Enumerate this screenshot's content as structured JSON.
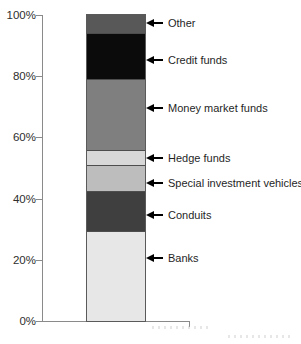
{
  "chart_data": {
    "type": "bar",
    "subtype": "stacked-percentage-column",
    "title": "",
    "xlabel": "",
    "ylabel": "",
    "categories": [
      ""
    ],
    "series": [
      {
        "name": "Banks",
        "value": 29.5,
        "color": "#e7e7e7"
      },
      {
        "name": "Conduits",
        "value": 13,
        "color": "#3f3f3f"
      },
      {
        "name": "Special investment vehicles",
        "value": 8.5,
        "color": "#bdbdbd"
      },
      {
        "name": "Hedge funds",
        "value": 5,
        "color": "#d8d8d8"
      },
      {
        "name": "Money market funds",
        "value": 23,
        "color": "#7f7f7f"
      },
      {
        "name": "Credit funds",
        "value": 15,
        "color": "#0b0b0b"
      },
      {
        "name": "Other",
        "value": 6,
        "color": "#585858"
      }
    ],
    "ylim": [
      0,
      100
    ],
    "y_ticks": [
      "0%",
      "20%",
      "40%",
      "60%",
      "80%",
      "100%"
    ],
    "grid": false,
    "legend_position": "arrow-callouts-right"
  },
  "colors": {
    "axis": "#8a8a8a",
    "tick_text": "#2e2e2e",
    "label_text": "#1f1f1f",
    "arrow": "#000000",
    "segment_border": "#4d4d4d",
    "background": "#ffffff"
  }
}
